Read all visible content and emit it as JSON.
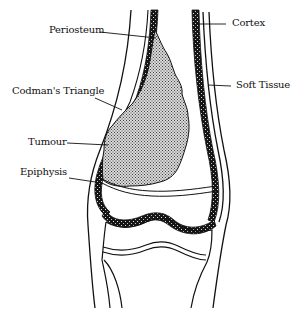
{
  "figure": {
    "labels": {
      "periosteum": "Periosteum",
      "codmans_triangle": "Codman's Triangle",
      "tumour": "Tumour",
      "epiphysis": "Epiphysis",
      "cortex": "Cortex",
      "soft_tissue": "Soft Tissue"
    },
    "colors": {
      "line": "#111111",
      "cortex_fill": "#1a1a1a",
      "tumour_fill": "#b8b8b8",
      "background": "#ffffff"
    }
  }
}
